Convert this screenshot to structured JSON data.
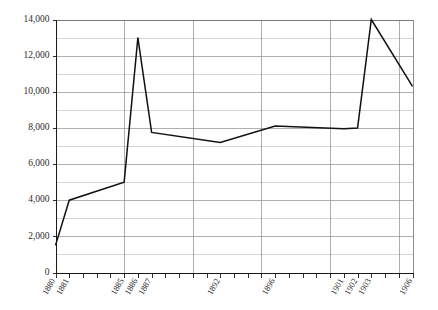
{
  "chart_data": {
    "type": "line",
    "title": "",
    "subtitle": "",
    "xlabel": "",
    "ylabel": "",
    "xlim": [
      1880,
      1906
    ],
    "ylim": [
      0,
      14000
    ],
    "grid": true,
    "legend_position": "none",
    "y_major_step": 2000,
    "y_minor_step": 1000,
    "y_ticks": [
      0,
      2000,
      4000,
      6000,
      8000,
      10000,
      12000,
      14000
    ],
    "y_tick_labels": [
      "0",
      "2,000",
      "4,000",
      "6,000",
      "8,000",
      "10,000",
      "12,000",
      "14,000"
    ],
    "x_minor_tick_years": [
      1880,
      1881,
      1882,
      1883,
      1884,
      1885,
      1886,
      1887,
      1888,
      1889,
      1890,
      1891,
      1892,
      1893,
      1894,
      1895,
      1896,
      1897,
      1898,
      1899,
      1900,
      1901,
      1902,
      1903,
      1904,
      1905,
      1906
    ],
    "x_gridline_years": [
      1880,
      1885,
      1890,
      1895,
      1900,
      1905
    ],
    "x_tick_labels": [
      "1880",
      "1881",
      "1885",
      "1886",
      "1887",
      "1892",
      "1896",
      "1901",
      "1902",
      "1903",
      "1906"
    ],
    "x_tick_label_years": [
      1880,
      1881,
      1885,
      1886,
      1887,
      1892,
      1896,
      1901,
      1902,
      1903,
      1906
    ],
    "series": [
      {
        "name": "series-1",
        "color": "#111111",
        "x": [
          1880,
          1881,
          1885,
          1886,
          1887,
          1892,
          1896,
          1901,
          1902,
          1903,
          1906
        ],
        "values": [
          1500,
          4000,
          5000,
          13000,
          7750,
          7200,
          8100,
          7950,
          8000,
          14000,
          10300
        ]
      }
    ],
    "colors": {
      "line": "#111111",
      "axis": "#1a1a1a",
      "grid_major": "#8f8f8f",
      "grid_minor": "#b9b9b9",
      "background": "#ffffff",
      "text": "#2b2b2b"
    }
  }
}
